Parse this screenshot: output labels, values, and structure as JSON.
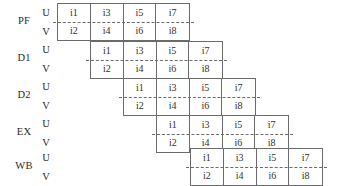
{
  "diagram": {
    "grid_color": "#6b6b6b",
    "text_color": "#2f2f2f",
    "background": "#ffffff",
    "sub_rows": {
      "upper": "U",
      "lower": "V"
    },
    "columns_per_band": 4,
    "stages": [
      {
        "name": "PF",
        "upper": [
          "i1",
          "i3",
          "i5",
          "i7"
        ],
        "lower": [
          "i2",
          "i4",
          "i6",
          "i8"
        ]
      },
      {
        "name": "D1",
        "upper": [
          "i1",
          "i3",
          "i5",
          "i7"
        ],
        "lower": [
          "i2",
          "i4",
          "i6",
          "i8"
        ]
      },
      {
        "name": "D2",
        "upper": [
          "i1",
          "i3",
          "i5",
          "i7"
        ],
        "lower": [
          "i2",
          "i4",
          "i6",
          "i8"
        ]
      },
      {
        "name": "EX",
        "upper": [
          "i1",
          "i3",
          "i5",
          "i7"
        ],
        "lower": [
          "i2",
          "i4",
          "i6",
          "i8"
        ]
      },
      {
        "name": "WB",
        "upper": [
          "i1",
          "i3",
          "i5",
          "i7"
        ],
        "lower": [
          "i2",
          "i4",
          "i6",
          "i8"
        ]
      }
    ],
    "layout": {
      "band_left": [
        57,
        90,
        123,
        156,
        190
      ],
      "band_top": [
        3,
        40.5,
        78,
        115,
        148
      ],
      "band_width": 133,
      "band_height": 38,
      "stage_label_x": 10,
      "stage_label_y": [
        16,
        53,
        90,
        127,
        161
      ],
      "uv_label_x": 40,
      "uv_upper_y": [
        8,
        45,
        82,
        119,
        153
      ],
      "uv_lower_y": [
        27,
        64,
        101,
        138,
        172
      ]
    }
  }
}
